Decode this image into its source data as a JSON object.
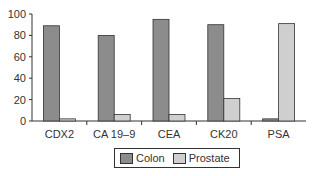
{
  "chart_data": {
    "type": "bar",
    "title": "",
    "xlabel": "",
    "ylabel": "",
    "categories": [
      "CDX2",
      "CA 19–9",
      "CEA",
      "CK20",
      "PSA"
    ],
    "series": [
      {
        "name": "Colon",
        "color": "#8c8c8c",
        "values": [
          89,
          80,
          95,
          90,
          2
        ]
      },
      {
        "name": "Prostate",
        "color": "#cfcfcf",
        "values": [
          2,
          6,
          6,
          21,
          91
        ]
      }
    ],
    "ylim": [
      0,
      100
    ],
    "yticks": [
      "0",
      "20",
      "40",
      "60",
      "80",
      "100"
    ],
    "grid": false,
    "legend_position": "bottom"
  },
  "legend": {
    "items": [
      {
        "label": "Colon",
        "color": "#8c8c8c"
      },
      {
        "label": "Prostate",
        "color": "#cfcfcf"
      }
    ]
  }
}
